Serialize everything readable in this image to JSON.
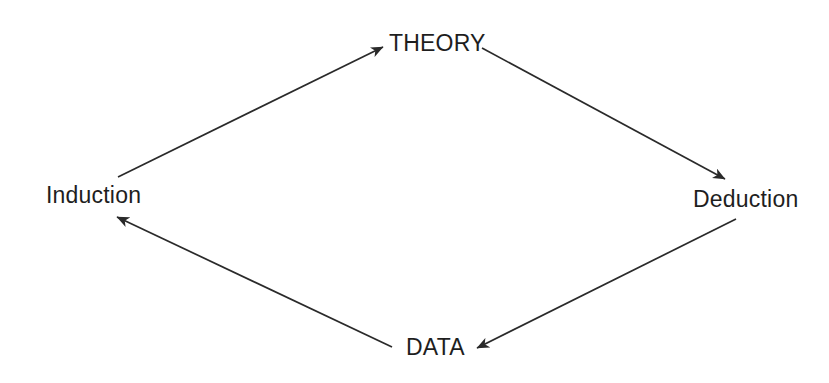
{
  "diagram": {
    "type": "cycle-diagram",
    "background_color": "#ffffff",
    "stroke_color": "#2a2a2a",
    "text_color": "#1e1e1e",
    "nodes": [
      {
        "id": "theory",
        "label": "THEORY",
        "position": "top",
        "x": 434,
        "y": 44
      },
      {
        "id": "deduction",
        "label": "Deduction",
        "position": "right",
        "x": 741,
        "y": 200
      },
      {
        "id": "data",
        "label": "DATA",
        "position": "bottom",
        "x": 434,
        "y": 347
      },
      {
        "id": "induction",
        "label": "Induction",
        "position": "left",
        "x": 92,
        "y": 196
      }
    ],
    "edges": [
      {
        "id": "induction-to-theory",
        "from": "induction",
        "to": "theory",
        "label": "",
        "x1": 118,
        "y1": 177,
        "x2": 383,
        "y2": 47
      },
      {
        "id": "theory-to-deduction",
        "from": "theory",
        "to": "deduction",
        "label": "",
        "x1": 482,
        "y1": 48,
        "x2": 725,
        "y2": 179
      },
      {
        "id": "deduction-to-data",
        "from": "deduction",
        "to": "data",
        "label": "",
        "x1": 736,
        "y1": 219,
        "x2": 477,
        "y2": 348
      },
      {
        "id": "data-to-induction",
        "from": "data",
        "to": "induction",
        "label": "",
        "x1": 392,
        "y1": 347,
        "x2": 117,
        "y2": 217
      }
    ]
  }
}
